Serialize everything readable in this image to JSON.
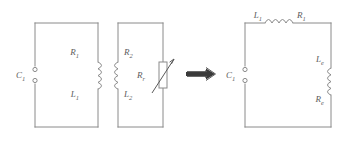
{
  "figure": {
    "kind": "circuit-diagram",
    "line_color": "#8a8a8a",
    "label_color": "#5c5c5c",
    "background": "#ffffff",
    "relation_symbol": "implies-double-arrow"
  },
  "left_circuit": {
    "name": "transformer-coupled-circuit",
    "source": {
      "label": "C",
      "subscript": "1",
      "terminals": 2
    },
    "primary": {
      "resistor_label": "R",
      "resistor_subscript": "1",
      "inductor_label": "L",
      "inductor_subscript": "1"
    },
    "secondary": {
      "resistor_label": "R",
      "resistor_subscript": "2",
      "inductor_label": "L",
      "inductor_subscript": "2"
    },
    "variable_resistor": {
      "label": "R",
      "subscript": "r",
      "type": "variable"
    }
  },
  "right_circuit": {
    "name": "equivalent-series-circuit",
    "source": {
      "label": "C",
      "subscript": "1",
      "terminals": 2
    },
    "top_branch": {
      "inductor_label": "L",
      "inductor_subscript": "1",
      "resistor_label": "R",
      "resistor_subscript": "1"
    },
    "right_branch": {
      "inductor_label": "L",
      "inductor_subscript": "e",
      "resistor_label": "R",
      "resistor_subscript": "e"
    }
  }
}
